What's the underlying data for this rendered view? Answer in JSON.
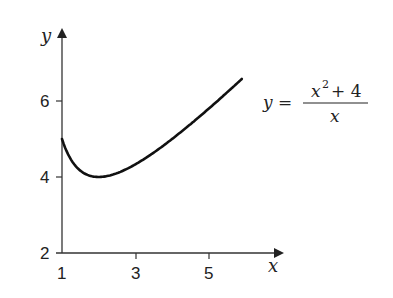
{
  "chart_data": {
    "type": "line",
    "title": "",
    "xlabel": "x",
    "ylabel": "y",
    "xlim": [
      1,
      6
    ],
    "ylim": [
      2,
      7
    ],
    "x_ticks": [
      "1",
      "3",
      "5"
    ],
    "y_ticks": [
      "2",
      "4",
      "6"
    ],
    "grid": false,
    "legend": "none",
    "annotation": {
      "lhs": "y",
      "equals": "=",
      "numerator_var": "x",
      "numerator_exp": "2",
      "numerator_rest": "+ 4",
      "denominator": "x",
      "text": "y = (x^2 + 4) / x"
    },
    "series": [
      {
        "name": "y = (x^2 + 4)/x",
        "x": [
          1.0,
          1.25,
          1.5,
          1.75,
          2.0,
          2.5,
          3.0,
          3.5,
          4.0,
          4.5,
          5.0,
          5.5,
          5.9
        ],
        "y": [
          5.0,
          4.45,
          4.17,
          4.04,
          4.0,
          4.1,
          4.33,
          4.64,
          5.0,
          5.39,
          5.8,
          6.23,
          6.58
        ]
      }
    ]
  }
}
